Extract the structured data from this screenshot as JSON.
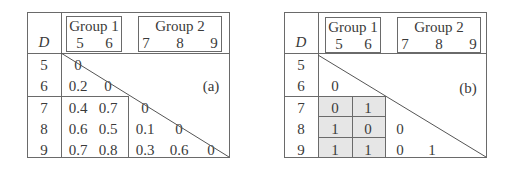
{
  "tables": [
    {
      "id": "a",
      "label": "(a)",
      "corner_label": "D",
      "groups": [
        {
          "title": "Group 1",
          "columns": [
            "5",
            "6"
          ]
        },
        {
          "title": "Group 2",
          "columns": [
            "7",
            "8",
            "9"
          ]
        }
      ],
      "row_labels": [
        "5",
        "6",
        "7",
        "8",
        "9"
      ],
      "cells": [
        [
          "0",
          "",
          "",
          "",
          ""
        ],
        [
          "0.2",
          "0",
          "",
          "",
          ""
        ],
        [
          "0.4",
          "0.7",
          "0",
          "",
          ""
        ],
        [
          "0.6",
          "0.5",
          "0.1",
          "0",
          ""
        ],
        [
          "0.7",
          "0.8",
          "0.3",
          "0.6",
          "0"
        ]
      ],
      "shaded_block": false
    },
    {
      "id": "b",
      "label": "(b)",
      "corner_label": "D",
      "groups": [
        {
          "title": "Group 1",
          "columns": [
            "5",
            "6"
          ]
        },
        {
          "title": "Group 2",
          "columns": [
            "7",
            "8",
            "9"
          ]
        }
      ],
      "row_labels": [
        "5",
        "6",
        "7",
        "8",
        "9"
      ],
      "cells": [
        [
          "",
          "",
          "",
          "",
          ""
        ],
        [
          "0",
          "",
          "",
          "",
          ""
        ],
        [
          "0",
          "1",
          "",
          "",
          ""
        ],
        [
          "1",
          "0",
          "0",
          "",
          ""
        ],
        [
          "1",
          "1",
          "0",
          "1",
          ""
        ]
      ],
      "shaded_block": true,
      "shade_color": "#e6e6e6"
    }
  ]
}
